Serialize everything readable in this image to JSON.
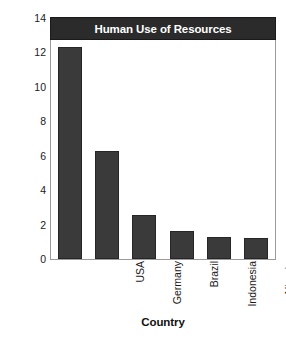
{
  "chart_data": {
    "type": "bar",
    "title": "Human Use of Resources",
    "xlabel": "Country",
    "ylabel": "Estimated hectares of land used",
    "categories": [
      "USA",
      "Germany",
      "Brazil",
      "Indonesia",
      "Nigeria",
      "India"
    ],
    "values": [
      12.3,
      6.3,
      2.55,
      1.6,
      1.25,
      1.2
    ],
    "ylim": [
      0,
      14
    ],
    "yticks": [
      0,
      2,
      4,
      6,
      8,
      10,
      12,
      14
    ],
    "ytick_labels": [
      "0",
      "2",
      "4",
      "6",
      "8",
      "10",
      "12",
      "14"
    ],
    "grid": false,
    "legend": "none",
    "bar_color": "#3a3a3a",
    "bar_edge_color": "#262626",
    "title_bar_color": "#2b2b2b",
    "title_text_color": "#ffffff",
    "frame_color": "#9b9b9b",
    "background": "#ffffff"
  }
}
